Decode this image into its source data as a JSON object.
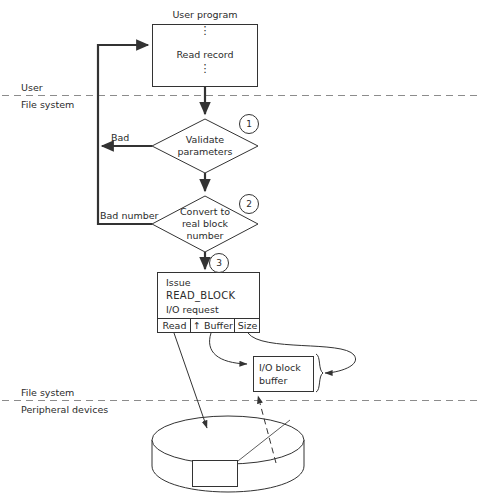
{
  "diagram": {
    "title_block": {
      "user_program_caption": "User program",
      "read_record": "Read record",
      "vertical_dots": "⋮"
    },
    "layer_dividers": [
      {
        "above": "User",
        "below": "File system"
      },
      {
        "above": "File system",
        "below": "Peripheral devices"
      }
    ],
    "steps": [
      {
        "number": "1",
        "label_lines": [
          "Validate",
          "parameters"
        ],
        "shape": "diamond"
      },
      {
        "number": "2",
        "label_lines": [
          "Convert to",
          "real block",
          "number"
        ],
        "shape": "diamond"
      },
      {
        "number": "3",
        "label_lines": [
          "Issue",
          "READ_BLOCK",
          "I/O request"
        ],
        "shape": "rect"
      }
    ],
    "error_edges": [
      {
        "label": "Bad",
        "from_step": "1"
      },
      {
        "label": "Bad number",
        "from_step": "2"
      }
    ],
    "request_fields": [
      {
        "label": "Read"
      },
      {
        "label": "↑ Buffer"
      },
      {
        "label": "Size"
      }
    ],
    "io_buffer": {
      "lines": [
        "I/O block",
        "buffer"
      ]
    },
    "disk": {
      "block_label": ""
    },
    "colors": {
      "ink": "#2b2b2b",
      "line": "#333333",
      "dashed": "#8c8c8c",
      "paper": "#ffffff"
    }
  }
}
